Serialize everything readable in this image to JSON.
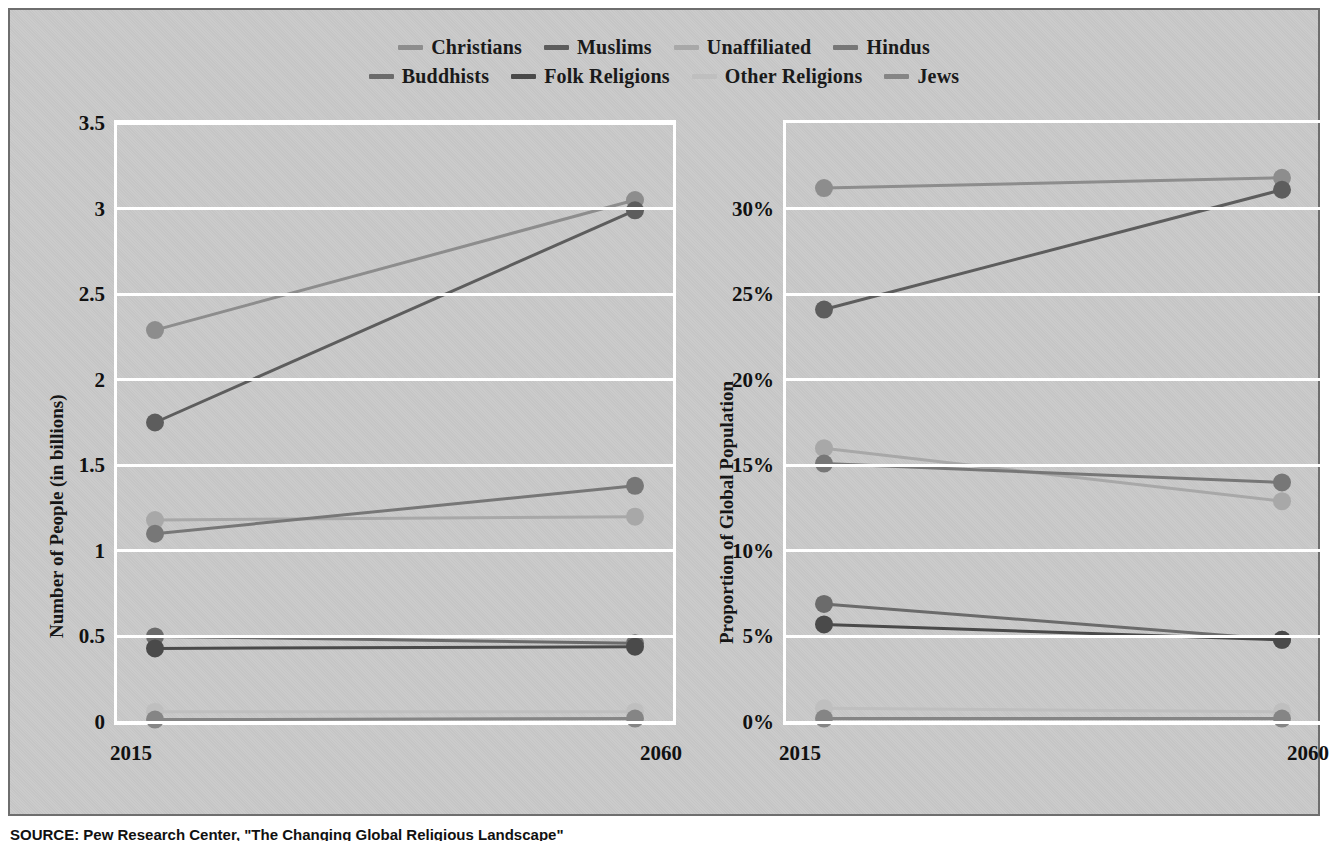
{
  "figure": {
    "background_color": "#c9c9c9",
    "border_color": "#6e6e6e"
  },
  "legend": {
    "rows": [
      [
        {
          "label": "Christians",
          "color": "#8d8d8d"
        },
        {
          "label": "Muslims",
          "color": "#5d5d5d"
        },
        {
          "label": "Unaffiliated",
          "color": "#a8a8a8"
        },
        {
          "label": "Hindus",
          "color": "#777777"
        }
      ],
      [
        {
          "label": "Buddhists",
          "color": "#6b6b6b"
        },
        {
          "label": "Folk Religions",
          "color": "#4a4a4a"
        },
        {
          "label": "Other Religions",
          "color": "#bfbfbf"
        },
        {
          "label": "Jews",
          "color": "#858585"
        }
      ]
    ]
  },
  "source": {
    "text": "SOURCE: Pew Research Center, \"The Changing Global Religious Landscape\""
  },
  "chart_data": [
    {
      "type": "line",
      "id": "left",
      "title": "",
      "xlabel": "",
      "ylabel": "Number of People (in billions)",
      "x": [
        "2015",
        "2060"
      ],
      "xticklabels": [
        "2015",
        "2060"
      ],
      "yticklabels": [
        "0",
        "0.5",
        "1",
        "1.5",
        "2",
        "2.5",
        "3",
        "3.5"
      ],
      "yticks": [
        0,
        0.5,
        1,
        1.5,
        2,
        2.5,
        3,
        3.5
      ],
      "ylim": [
        0,
        3.5
      ],
      "grid": true,
      "legend_position": "top-center",
      "series": [
        {
          "name": "Christians",
          "color": "#8d8d8d",
          "values": [
            2.29,
            3.05
          ]
        },
        {
          "name": "Muslims",
          "color": "#5d5d5d",
          "values": [
            1.75,
            2.99
          ]
        },
        {
          "name": "Unaffiliated",
          "color": "#a8a8a8",
          "values": [
            1.18,
            1.2
          ]
        },
        {
          "name": "Hindus",
          "color": "#777777",
          "values": [
            1.1,
            1.38
          ]
        },
        {
          "name": "Buddhists",
          "color": "#6b6b6b",
          "values": [
            0.5,
            0.46
          ]
        },
        {
          "name": "Folk Religions",
          "color": "#4a4a4a",
          "values": [
            0.43,
            0.44
          ]
        },
        {
          "name": "Other Religions",
          "color": "#bfbfbf",
          "values": [
            0.06,
            0.06
          ]
        },
        {
          "name": "Jews",
          "color": "#858585",
          "values": [
            0.014,
            0.02
          ]
        }
      ]
    },
    {
      "type": "line",
      "id": "right",
      "title": "",
      "xlabel": "",
      "ylabel": "Proportion of Global Population",
      "x": [
        "2015",
        "2060"
      ],
      "xticklabels": [
        "2015",
        "2060"
      ],
      "yticklabels": [
        "0%",
        "5%",
        "10%",
        "15%",
        "20%",
        "25%",
        "30%"
      ],
      "yticks": [
        0,
        5,
        10,
        15,
        20,
        25,
        30
      ],
      "ylim": [
        0,
        35
      ],
      "grid": true,
      "legend_position": "top-center",
      "series": [
        {
          "name": "Christians",
          "color": "#8d8d8d",
          "values": [
            31.2,
            31.8
          ]
        },
        {
          "name": "Muslims",
          "color": "#5d5d5d",
          "values": [
            24.1,
            31.1
          ]
        },
        {
          "name": "Unaffiliated",
          "color": "#a8a8a8",
          "values": [
            16.0,
            12.9
          ]
        },
        {
          "name": "Hindus",
          "color": "#777777",
          "values": [
            15.1,
            14.0
          ]
        },
        {
          "name": "Buddhists",
          "color": "#6b6b6b",
          "values": [
            6.9,
            4.8
          ]
        },
        {
          "name": "Folk Religions",
          "color": "#4a4a4a",
          "values": [
            5.7,
            4.8
          ]
        },
        {
          "name": "Other Religions",
          "color": "#bfbfbf",
          "values": [
            0.8,
            0.6
          ]
        },
        {
          "name": "Jews",
          "color": "#858585",
          "values": [
            0.2,
            0.2
          ]
        }
      ]
    }
  ]
}
